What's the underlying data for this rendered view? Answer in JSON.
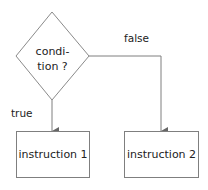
{
  "diagram": {
    "type": "flowchart",
    "decision": {
      "line1": "condi-",
      "line2": "tion ?"
    },
    "branches": {
      "true_label": "true",
      "false_label": "false"
    },
    "boxes": [
      {
        "label": "instruction 1"
      },
      {
        "label": "instruction 2"
      }
    ],
    "colors": {
      "stroke": "#7f7f7f",
      "text": "#222222",
      "background": "#ffffff"
    }
  }
}
